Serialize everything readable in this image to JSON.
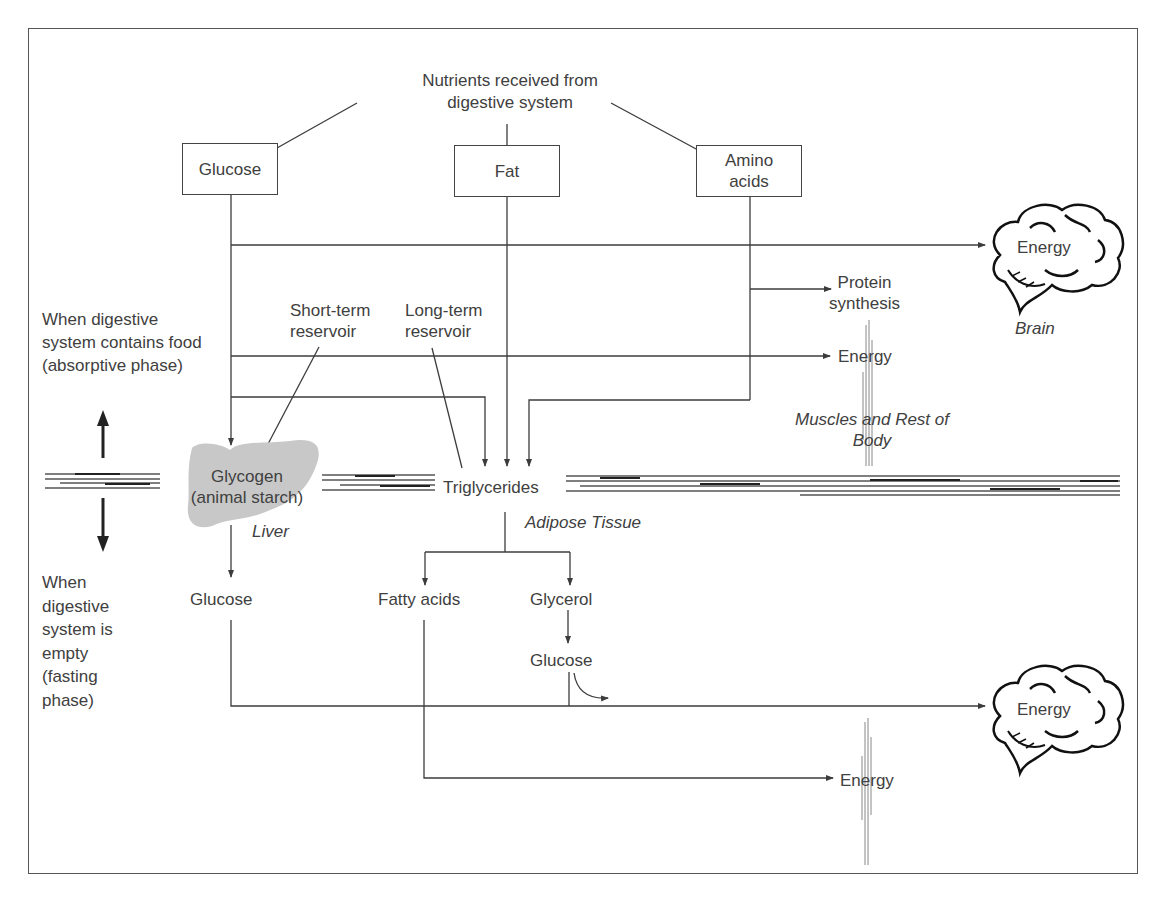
{
  "title": "Nutrients received from digestive system",
  "nutrients": {
    "glucose": "Glucose",
    "fat": "Fat",
    "amino_acids": "Amino acids"
  },
  "phases": {
    "absorptive": "When digestive system contains food (absorptive phase)",
    "fasting": "When digestive system is empty (fasting phase)"
  },
  "reservoirs": {
    "short_term": "Short-term reservoir",
    "long_term": "Long-term reservoir"
  },
  "absorptive_outputs": {
    "brain_energy": "Energy",
    "brain_label": "Brain",
    "protein_synthesis": "Protein synthesis",
    "muscle_energy": "Energy",
    "muscles_label": "Muscles and Rest of Body"
  },
  "storage": {
    "glycogen": "Glycogen (animal starch)",
    "liver_label": "Liver",
    "triglycerides": "Triglycerides",
    "adipose_label": "Adipose Tissue"
  },
  "fasting_outputs": {
    "liver_glucose": "Glucose",
    "fatty_acids": "Fatty acids",
    "glycerol": "Glycerol",
    "glycerol_glucose": "Glucose",
    "brain_energy": "Energy",
    "body_energy": "Energy"
  },
  "colors": {
    "line": "#3c3c3c",
    "text": "#404040",
    "liver_fill": "#c8c8c8",
    "frame": "#555555"
  }
}
